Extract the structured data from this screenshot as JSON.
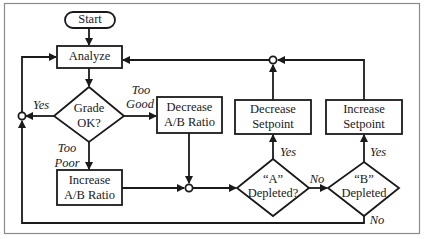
{
  "diagram": {
    "type": "flowchart",
    "nodes": {
      "start": {
        "label": "Start",
        "shape": "terminator"
      },
      "analyze": {
        "label": "Analyze",
        "shape": "process"
      },
      "grade_ok": {
        "line1": "Grade",
        "line2": "OK?",
        "shape": "decision"
      },
      "decrease_ab": {
        "line1": "Decrease",
        "line2": "A/B Ratio",
        "shape": "process"
      },
      "increase_ab": {
        "line1": "Increase",
        "line2": "A/B Ratio",
        "shape": "process"
      },
      "a_depleted": {
        "line1": "“A”",
        "line2": "Depleted?",
        "shape": "decision"
      },
      "b_depleted": {
        "line1": "“B”",
        "line2": "Depleted",
        "shape": "decision"
      },
      "decrease_setpoint": {
        "line1": "Decrease",
        "line2": "Setpoint",
        "shape": "process"
      },
      "increase_setpoint": {
        "line1": "Increase",
        "line2": "Setpoint",
        "shape": "process"
      }
    },
    "edge_labels": {
      "yes_grade": "Yes",
      "too_good_1": "Too",
      "too_good_2": "Good",
      "too_poor_1": "Too",
      "too_poor_2": "Poor",
      "yes_a": "Yes",
      "no_a": "No",
      "yes_b": "Yes",
      "no_b": "No"
    },
    "edges": [
      {
        "from": "start",
        "to": "analyze"
      },
      {
        "from": "analyze",
        "to": "grade_ok"
      },
      {
        "from": "grade_ok",
        "to": "junction_left",
        "label": "Yes"
      },
      {
        "from": "junction_left",
        "to": "analyze"
      },
      {
        "from": "grade_ok",
        "to": "decrease_ab",
        "label": "Too Good"
      },
      {
        "from": "grade_ok",
        "to": "increase_ab",
        "label": "Too Poor"
      },
      {
        "from": "decrease_ab",
        "to": "junction_mid"
      },
      {
        "from": "increase_ab",
        "to": "junction_mid"
      },
      {
        "from": "junction_mid",
        "to": "a_depleted"
      },
      {
        "from": "a_depleted",
        "to": "decrease_setpoint",
        "label": "Yes"
      },
      {
        "from": "a_depleted",
        "to": "b_depleted",
        "label": "No"
      },
      {
        "from": "b_depleted",
        "to": "increase_setpoint",
        "label": "Yes"
      },
      {
        "from": "b_depleted",
        "to": "junction_left",
        "label": "No"
      },
      {
        "from": "decrease_setpoint",
        "to": "junction_top"
      },
      {
        "from": "increase_setpoint",
        "to": "junction_top"
      },
      {
        "from": "junction_top",
        "to": "analyze"
      }
    ],
    "colors": {
      "stroke": "#1a1a1a",
      "frame": "#8a8a8a",
      "background": "#ffffff"
    }
  }
}
